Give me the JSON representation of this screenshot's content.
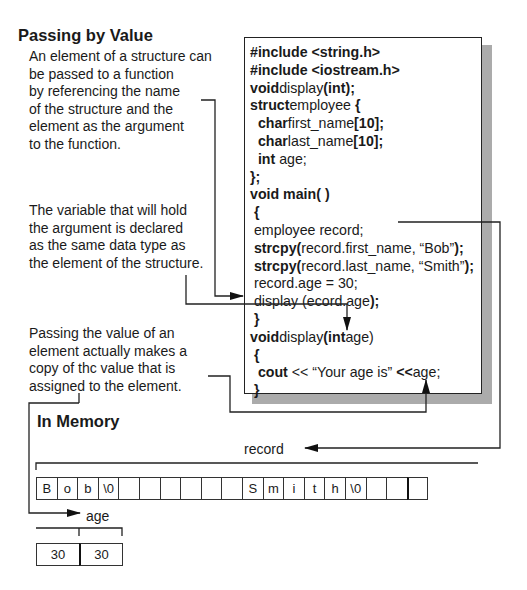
{
  "title": "Passing by Value",
  "notes": [
    "An element of a structure can\nbe passed to a function\nby referencing the name\nof the structure and the\nelement as the argument\nto the function.",
    "The variable that will hold\nthe argument is declared\nas the same data type as\nthe element of the structure.",
    "Passing the value of an\nelement actually makes a\ncopy of thc value that is\nassigned to the element."
  ],
  "code": [
    [
      {
        "t": "#include <string.h>",
        "b": true
      }
    ],
    [
      {
        "t": "#include <iostream.h>",
        "b": true
      }
    ],
    [
      {
        "t": "void",
        "b": true
      },
      {
        "t": "display",
        "b": false
      },
      {
        "t": "(int);",
        "b": true
      }
    ],
    [
      {
        "t": "struct",
        "b": true
      },
      {
        "t": "employee ",
        "b": false
      },
      {
        "t": "{",
        "b": true
      }
    ],
    [
      {
        "t": "  char",
        "b": true
      },
      {
        "t": "first_name",
        "b": false
      },
      {
        "t": "[10];",
        "b": true
      }
    ],
    [
      {
        "t": "  char",
        "b": true
      },
      {
        "t": "last_name",
        "b": false
      },
      {
        "t": "[10];",
        "b": true
      }
    ],
    [
      {
        "t": "  int ",
        "b": true
      },
      {
        "t": "age;",
        "b": false
      }
    ],
    [
      {
        "t": "};",
        "b": true
      }
    ],
    [
      {
        "t": "void main( )",
        "b": true
      }
    ],
    [
      {
        "t": " {",
        "b": true
      }
    ],
    [
      {
        "t": " employee record;",
        "b": false
      }
    ],
    [
      {
        "t": " strcpy(",
        "b": true
      },
      {
        "t": "record.first_name, “Bob”",
        "b": false
      },
      {
        "t": ");",
        "b": true
      }
    ],
    [
      {
        "t": " strcpy(",
        "b": true
      },
      {
        "t": "record.last_name, “Smith”",
        "b": false
      },
      {
        "t": ");",
        "b": true
      }
    ],
    [
      {
        "t": " record.age = 30;",
        "b": false
      }
    ],
    [
      {
        "t": " display (",
        "b": false
      },
      {
        "t": "ecord.age",
        "b": false
      },
      {
        "t": ");",
        "b": true
      }
    ],
    [
      {
        "t": " }",
        "b": true
      }
    ],
    [
      {
        "t": "void",
        "b": true
      },
      {
        "t": "display",
        "b": false
      },
      {
        "t": "(int",
        "b": true
      },
      {
        "t": "age)",
        "b": false
      }
    ],
    [
      {
        "t": " {",
        "b": true
      }
    ],
    [
      {
        "t": "  cout",
        "b": true
      },
      {
        "t": " << “Your age is” ",
        "b": false
      },
      {
        "t": "<<",
        "b": true
      },
      {
        "t": "age;",
        "b": false
      }
    ],
    [
      {
        "t": " }",
        "b": true
      }
    ]
  ],
  "memory": {
    "heading": "In Memory",
    "record_label": "record",
    "age_label": "age",
    "record_cells": [
      "B",
      "o",
      "b",
      "\\0",
      "",
      "",
      "",
      "",
      "",
      "",
      "S",
      "m",
      "i",
      "t",
      "h",
      "\\0",
      "",
      "",
      ""
    ],
    "age_cells": [
      "30",
      "30"
    ]
  },
  "colors": {
    "ink": "#1a1a1a",
    "shadow": "#ababab",
    "background": "#ffffff"
  }
}
